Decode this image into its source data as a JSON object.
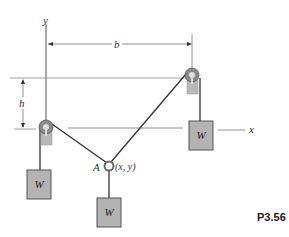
{
  "figure": {
    "problem_id": "P3.56",
    "axes": {
      "x_label": "x",
      "y_label": "y"
    },
    "dimensions": {
      "horizontal": "b",
      "vertical": "h"
    },
    "point": {
      "name": "A",
      "coords": "(x, y)"
    },
    "weights": [
      {
        "label": "W",
        "position": "left-hanging"
      },
      {
        "label": "W",
        "position": "center-hanging-from-ring"
      },
      {
        "label": "W",
        "position": "right-hanging"
      }
    ],
    "colors": {
      "weight_fill": "#b3b3b3",
      "weight_stroke": "#555555",
      "rope": "#333333",
      "pulley": "#8a8a8a",
      "dimension_line": "#666666"
    }
  }
}
